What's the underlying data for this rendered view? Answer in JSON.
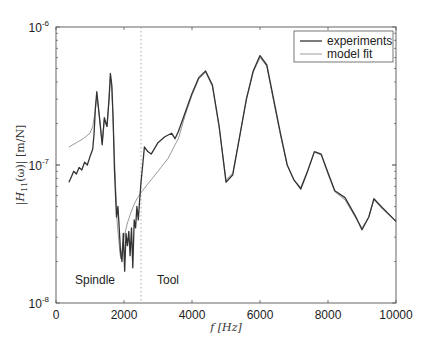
{
  "chart_data": {
    "type": "line",
    "title": "",
    "xlabel": "f [Hz]",
    "ylabel": "|H11(ω)| [m/N]",
    "xlim": [
      0,
      10000
    ],
    "ylim": [
      1e-08,
      1e-06
    ],
    "yscale": "log",
    "xticks": [
      "0",
      "2000",
      "4000",
      "6000",
      "8000",
      "10000"
    ],
    "yticks": [
      "10^-8",
      "10^-7",
      "10^-6"
    ],
    "grid": false,
    "legend_position": "upper right",
    "legend": [
      "experiments",
      "model fit"
    ],
    "annotations": [
      {
        "text": "Spindle",
        "x": 1200,
        "y": 1.4e-08
      },
      {
        "text": "Tool",
        "x": 3000,
        "y": 1.4e-08
      },
      {
        "type": "vertical-dotted-line",
        "x": 2500
      }
    ],
    "series": [
      {
        "name": "experiments",
        "color": "#333333",
        "x": [
          380,
          450,
          520,
          600,
          680,
          760,
          840,
          920,
          1000,
          1080,
          1120,
          1160,
          1200,
          1280,
          1360,
          1420,
          1500,
          1560,
          1600,
          1640,
          1680,
          1720,
          1780,
          1820,
          1860,
          1900,
          1940,
          1980,
          2020,
          2060,
          2100,
          2140,
          2180,
          2220,
          2260,
          2300,
          2340,
          2380,
          2420,
          2460,
          2500,
          2550,
          2600,
          2700,
          2800,
          3000,
          3200,
          3400,
          3500,
          3600,
          3800,
          4000,
          4200,
          4400,
          4600,
          4800,
          5000,
          5200,
          5400,
          5600,
          5800,
          6000,
          6200,
          6400,
          6600,
          6800,
          7000,
          7200,
          7400,
          7600,
          7800,
          8000,
          8200,
          8500,
          8800,
          9000,
          9200,
          9350,
          9600,
          10000
        ],
        "values": [
          7.5e-08,
          8.2e-08,
          9e-08,
          8.6e-08,
          9.6e-08,
          9.2e-08,
          1.05e-07,
          1e-07,
          1.15e-07,
          1.3e-07,
          1.7e-07,
          2.6e-07,
          3.4e-07,
          2.2e-07,
          1.4e-07,
          2.2e-07,
          1.9e-07,
          3e-07,
          4.6e-07,
          3.8e-07,
          2.2e-07,
          9e-08,
          4.2e-08,
          5e-08,
          3.5e-08,
          2.3e-08,
          2e-08,
          3.2e-08,
          1.7e-08,
          3.2e-08,
          2.6e-08,
          3.3e-08,
          2.2e-08,
          3.5e-08,
          1.8e-08,
          4e-08,
          3.5e-08,
          5e-08,
          4e-08,
          5.5e-08,
          7.5e-08,
          1e-07,
          1.35e-07,
          1.25e-07,
          1.2e-07,
          1.45e-07,
          1.6e-07,
          1.7e-07,
          1.55e-07,
          1.75e-07,
          2.4e-07,
          3.3e-07,
          4.3e-07,
          4.8e-07,
          3.8e-07,
          1.9e-07,
          7.5e-08,
          8.5e-08,
          1.6e-07,
          3e-07,
          4.8e-07,
          6.2e-07,
          5.3e-07,
          3e-07,
          1.7e-07,
          1e-07,
          7.8e-08,
          6.7e-08,
          9e-08,
          1.25e-07,
          1.2e-07,
          8.8e-08,
          6.5e-08,
          5.8e-08,
          4.3e-08,
          3.4e-08,
          4.2e-08,
          5.7e-08,
          4.9e-08,
          3.9e-08
        ]
      },
      {
        "name": "model fit",
        "color": "#999999",
        "x": [
          380,
          600,
          800,
          1000,
          1080,
          1160,
          1200,
          1280,
          1360,
          1420,
          1500,
          1560,
          1600,
          1640,
          1700,
          1760,
          1800,
          1850,
          1900,
          1950,
          2000,
          2100,
          2200,
          2300,
          2400,
          2500,
          2700,
          3000,
          3300,
          3500,
          3600,
          3800,
          4000,
          4200,
          4400,
          4600,
          4800,
          5000,
          5200,
          5400,
          5600,
          5800,
          6000,
          6200,
          6400,
          6600,
          6800,
          7000,
          7200,
          7400,
          7600,
          7800,
          8000,
          8200,
          8500,
          8800,
          9000,
          9200,
          9350,
          9600,
          10000
        ],
        "values": [
          1.35e-07,
          1.45e-07,
          1.55e-07,
          1.7e-07,
          1.9e-07,
          2.5e-07,
          3.2e-07,
          2.2e-07,
          1.45e-07,
          2.1e-07,
          1.9e-07,
          2.9e-07,
          4.4e-07,
          3.6e-07,
          1.5e-07,
          6.5e-08,
          3.8e-08,
          2.8e-08,
          2.1e-08,
          2.5e-08,
          3e-08,
          3.8e-08,
          4.5e-08,
          5.2e-08,
          5.8e-08,
          6.3e-08,
          7.3e-08,
          9e-08,
          1.12e-07,
          1.4e-07,
          1.55e-07,
          2.3e-07,
          3.2e-07,
          4.2e-07,
          4.7e-07,
          3.7e-07,
          1.85e-07,
          7.8e-08,
          8.8e-08,
          1.6e-07,
          3e-07,
          4.7e-07,
          6e-07,
          5.2e-07,
          2.9e-07,
          1.65e-07,
          1e-07,
          7.7e-08,
          6.9e-08,
          9.1e-08,
          1.24e-07,
          1.18e-07,
          8.6e-08,
          6.4e-08,
          5.6e-08,
          4.2e-08,
          3.5e-08,
          4.2e-08,
          5.6e-08,
          4.8e-08,
          3.9e-08
        ]
      }
    ]
  },
  "labels": {
    "x_axis": "f [Hz]",
    "y_axis_prefix": "|H",
    "y_axis_sub": "11",
    "y_axis_suffix": "(ω)| [m/N]",
    "spindle": "Spindle",
    "tool": "Tool",
    "legend_exp": "experiments",
    "legend_fit": "model fit",
    "ytick_base": "10",
    "ytick_exp": [
      "-8",
      "-7",
      "-6"
    ]
  }
}
